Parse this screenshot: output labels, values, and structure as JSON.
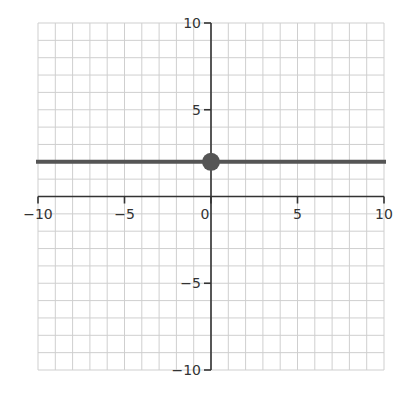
{
  "chart_data": {
    "type": "line",
    "title": "",
    "xlabel": "",
    "ylabel": "",
    "xlim": [
      -10,
      10
    ],
    "ylim": [
      -10,
      10
    ],
    "grid": true,
    "grid_step": 1,
    "x_ticks": [
      -10,
      -5,
      0,
      5,
      10
    ],
    "y_ticks": [
      10,
      5,
      -5,
      -10
    ],
    "x_tick_labels": [
      "−10",
      "−5",
      "0",
      "5",
      "10"
    ],
    "y_tick_labels": [
      "10",
      "5",
      "−5",
      "−10"
    ],
    "series": [
      {
        "name": "horizontal line y = 2",
        "kind": "line",
        "equation": "y = 2",
        "x": [
          -10,
          10
        ],
        "y": [
          2,
          2
        ],
        "color": "#555555"
      },
      {
        "name": "point",
        "kind": "point",
        "x": [
          0
        ],
        "y": [
          2
        ],
        "color": "#555555"
      }
    ],
    "legend": null
  },
  "colors": {
    "grid": "#cfcfcf",
    "axis": "#333333",
    "line": "#555555",
    "point": "#555555"
  }
}
